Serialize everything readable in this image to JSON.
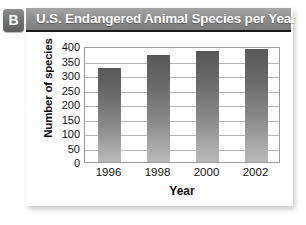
{
  "figure": {
    "badge_label": "B"
  },
  "chart_data": {
    "type": "bar",
    "title": "U.S. Endangered Animal Species per Year",
    "xlabel": "Year",
    "ylabel": "Number of species",
    "categories": [
      "1996",
      "1998",
      "2000",
      "2002"
    ],
    "values": [
      325,
      370,
      383,
      390
    ],
    "ylim": [
      0,
      400
    ],
    "ytick_labels": [
      "400",
      "350",
      "300",
      "250",
      "200",
      "150",
      "100",
      "50",
      "0"
    ],
    "ytick_values": [
      400,
      350,
      300,
      250,
      200,
      150,
      100,
      50,
      0
    ],
    "grid": true,
    "legend": "none",
    "bar_color_top": "#585858",
    "bar_color_bottom": "#b9b9b9"
  }
}
